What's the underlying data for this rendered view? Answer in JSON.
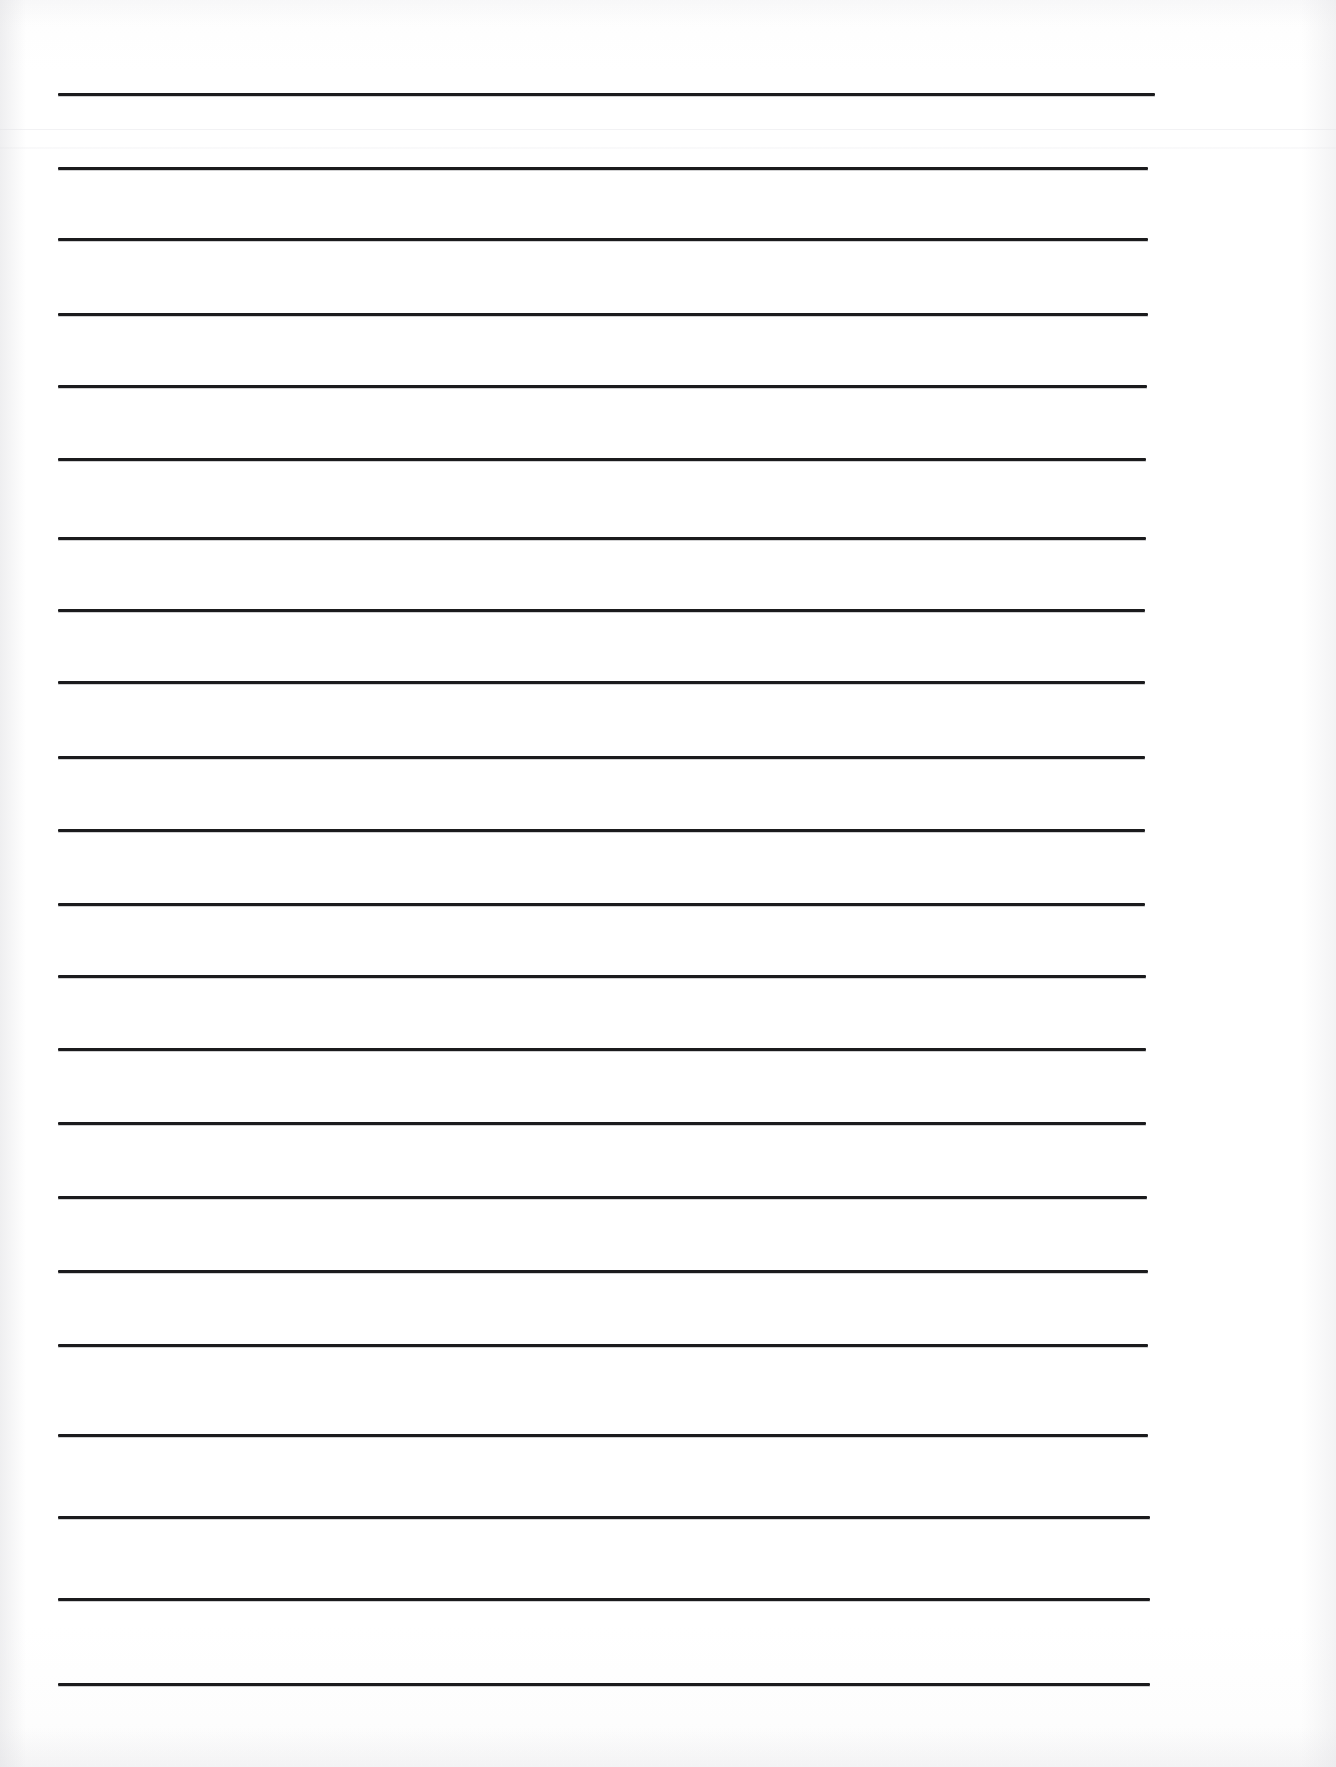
{
  "document": {
    "kind": "scanned-lined-paper",
    "title": "Blank Lined Writing Paper",
    "page_width": 1336,
    "page_height": 1767,
    "background_color": "#ffffff",
    "paper_color": "#fdfdfd",
    "rule_color": "#1b1b1d",
    "seam_color": "#f1f1f3",
    "content_text": ""
  },
  "ruling": {
    "style": "wide-ruled",
    "line_count": 20,
    "line_thickness_px": 3,
    "line_spacing_px": 82,
    "left_margin_px": 58,
    "right_margin_px": 1150,
    "first_line_y_px": 93,
    "last_line_y_px": 1684,
    "has_vertical_margin_rule": false,
    "has_header_rule": false,
    "lines": [
      {
        "index": 1,
        "y": 93,
        "x1": 58,
        "x2": 1155
      },
      {
        "index": 2,
        "y": 167,
        "x1": 58,
        "x2": 1148
      },
      {
        "index": 3,
        "y": 238,
        "x1": 58,
        "x2": 1148
      },
      {
        "index": 4,
        "y": 313,
        "x1": 58,
        "x2": 1148
      },
      {
        "index": 5,
        "y": 385,
        "x1": 58,
        "x2": 1147
      },
      {
        "index": 6,
        "y": 458,
        "x1": 58,
        "x2": 1146
      },
      {
        "index": 7,
        "y": 537,
        "x1": 58,
        "x2": 1146
      },
      {
        "index": 8,
        "y": 609,
        "x1": 58,
        "x2": 1145
      },
      {
        "index": 9,
        "y": 681,
        "x1": 58,
        "x2": 1145
      },
      {
        "index": 10,
        "y": 756,
        "x1": 58,
        "x2": 1145
      },
      {
        "index": 11,
        "y": 829,
        "x1": 58,
        "x2": 1145
      },
      {
        "index": 12,
        "y": 903,
        "x1": 58,
        "x2": 1145
      },
      {
        "index": 13,
        "y": 975,
        "x1": 58,
        "x2": 1146
      },
      {
        "index": 14,
        "y": 1048,
        "x1": 58,
        "x2": 1146
      },
      {
        "index": 15,
        "y": 1122,
        "x1": 58,
        "x2": 1146
      },
      {
        "index": 16,
        "y": 1196,
        "x1": 58,
        "x2": 1147
      },
      {
        "index": 17,
        "y": 1270,
        "x1": 58,
        "x2": 1148
      },
      {
        "index": 18,
        "y": 1344,
        "x1": 58,
        "x2": 1148
      },
      {
        "index": 19,
        "y": 1434,
        "x1": 58,
        "x2": 1148
      },
      {
        "index": 20,
        "y": 1516,
        "x1": 58,
        "x2": 1150
      },
      {
        "index": 21,
        "y": 1598,
        "x1": 58,
        "x2": 1150
      },
      {
        "index": 22,
        "y": 1683,
        "x1": 58,
        "x2": 1150
      }
    ]
  },
  "artifacts": {
    "seams": [
      {
        "name": "upper-scan-seam",
        "y": 129,
        "opacity": 0.9,
        "soft": false
      },
      {
        "name": "lower-scan-seam",
        "y": 147,
        "opacity": 0.7,
        "soft": true
      }
    ],
    "vignette": true,
    "vignette_color": "#e4e4e7"
  }
}
